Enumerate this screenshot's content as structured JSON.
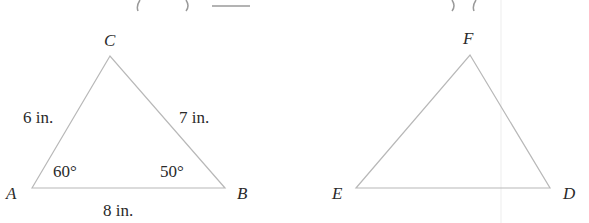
{
  "figure": {
    "triangle_abc": {
      "vertices": {
        "A": "A",
        "B": "B",
        "C": "C"
      },
      "sides": {
        "AC": "6 in.",
        "CB": "7 in.",
        "AB": "8 in."
      },
      "angles": {
        "A": "60°",
        "B": "50°"
      }
    },
    "triangle_def": {
      "vertices": {
        "D": "D",
        "E": "E",
        "F": "F"
      }
    }
  }
}
